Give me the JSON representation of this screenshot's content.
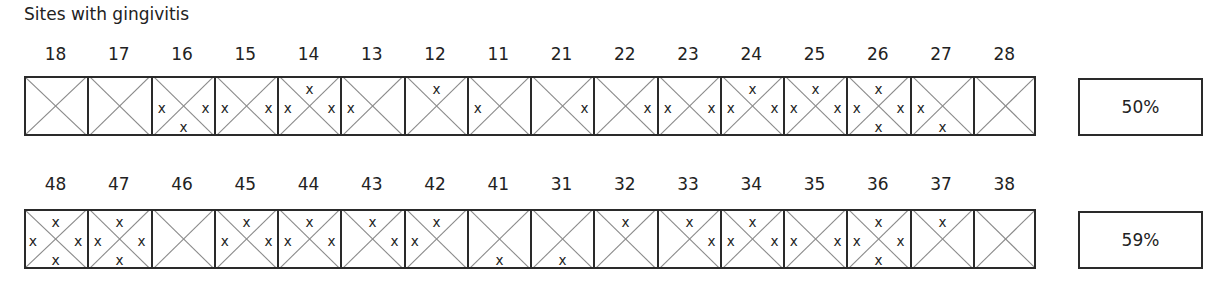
{
  "title": "Sites with gingivitis",
  "upper": {
    "teeth": [
      {
        "num": "18",
        "sites": []
      },
      {
        "num": "17",
        "sites": []
      },
      {
        "num": "16",
        "sites": [
          "left",
          "right",
          "bottom"
        ]
      },
      {
        "num": "15",
        "sites": [
          "left",
          "right"
        ]
      },
      {
        "num": "14",
        "sites": [
          "top",
          "left",
          "right"
        ]
      },
      {
        "num": "13",
        "sites": [
          "left"
        ]
      },
      {
        "num": "12",
        "sites": [
          "top"
        ]
      },
      {
        "num": "11",
        "sites": [
          "left"
        ]
      },
      {
        "num": "21",
        "sites": [
          "right"
        ]
      },
      {
        "num": "22",
        "sites": [
          "right"
        ]
      },
      {
        "num": "23",
        "sites": [
          "left",
          "right"
        ]
      },
      {
        "num": "24",
        "sites": [
          "top",
          "left",
          "right"
        ]
      },
      {
        "num": "25",
        "sites": [
          "top",
          "left",
          "right"
        ]
      },
      {
        "num": "26",
        "sites": [
          "top",
          "left",
          "right",
          "bottom"
        ]
      },
      {
        "num": "27",
        "sites": [
          "left",
          "bottom"
        ]
      },
      {
        "num": "28",
        "sites": []
      }
    ],
    "percentage": "50%"
  },
  "lower": {
    "teeth": [
      {
        "num": "48",
        "sites": [
          "top",
          "left",
          "right",
          "bottom"
        ]
      },
      {
        "num": "47",
        "sites": [
          "top",
          "left",
          "right",
          "bottom"
        ]
      },
      {
        "num": "46",
        "sites": []
      },
      {
        "num": "45",
        "sites": [
          "top",
          "left",
          "right"
        ]
      },
      {
        "num": "44",
        "sites": [
          "top",
          "left",
          "right"
        ]
      },
      {
        "num": "43",
        "sites": [
          "top",
          "right"
        ]
      },
      {
        "num": "42",
        "sites": [
          "top",
          "left"
        ]
      },
      {
        "num": "41",
        "sites": [
          "bottom"
        ]
      },
      {
        "num": "31",
        "sites": [
          "bottom"
        ]
      },
      {
        "num": "32",
        "sites": [
          "top"
        ]
      },
      {
        "num": "33",
        "sites": [
          "top",
          "right"
        ]
      },
      {
        "num": "34",
        "sites": [
          "top",
          "left",
          "right"
        ]
      },
      {
        "num": "35",
        "sites": [
          "left",
          "right"
        ]
      },
      {
        "num": "36",
        "sites": [
          "top",
          "left",
          "right",
          "bottom"
        ]
      },
      {
        "num": "37",
        "sites": [
          "top"
        ]
      },
      {
        "num": "38",
        "sites": []
      }
    ],
    "percentage": "59%"
  },
  "marker": "x",
  "colors": {
    "border": "#2a2a2a",
    "diagonal": "#8a8a8a",
    "text": "#222222"
  }
}
